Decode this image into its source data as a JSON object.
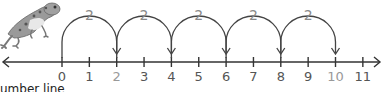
{
  "diagram": {
    "type": "number-line-skip-count",
    "caption": "umber line",
    "line": {
      "min": 0,
      "max": 11,
      "arrows_both_ends": true,
      "color": "#333333"
    },
    "ticks": [
      {
        "value": "0",
        "highlight": false
      },
      {
        "value": "1",
        "highlight": false
      },
      {
        "value": "2",
        "highlight": true
      },
      {
        "value": "3",
        "highlight": false
      },
      {
        "value": "4",
        "highlight": false
      },
      {
        "value": "5",
        "highlight": false
      },
      {
        "value": "6",
        "highlight": false
      },
      {
        "value": "7",
        "highlight": false
      },
      {
        "value": "8",
        "highlight": false
      },
      {
        "value": "9",
        "highlight": false
      },
      {
        "value": "10",
        "highlight": true
      },
      {
        "value": "11",
        "highlight": false
      }
    ],
    "jumps": [
      {
        "from": 0,
        "to": 2,
        "label": "2"
      },
      {
        "from": 2,
        "to": 4,
        "label": "2"
      },
      {
        "from": 4,
        "to": 6,
        "label": "2"
      },
      {
        "from": 6,
        "to": 8,
        "label": "2"
      },
      {
        "from": 8,
        "to": 10,
        "label": "2"
      }
    ],
    "colors": {
      "label": "#555555",
      "highlight_label": "#999999",
      "jump_label": "#8a8a8a",
      "arc": "#444444"
    },
    "illustration": "frog-icon"
  }
}
